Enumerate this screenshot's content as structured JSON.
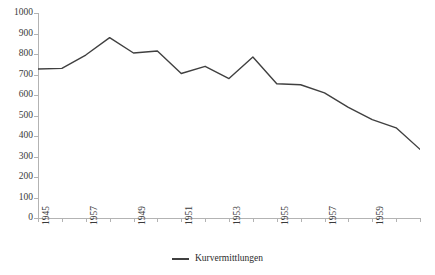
{
  "chart_data": {
    "type": "line",
    "title": "",
    "xlabel": "",
    "ylabel": "",
    "ylim": [
      0,
      1000
    ],
    "ytick_step": 100,
    "yticks": [
      0,
      100,
      200,
      300,
      400,
      500,
      600,
      700,
      800,
      900,
      1000
    ],
    "grid": false,
    "legend_position": "bottom-center",
    "line_color": "#404040",
    "axis_color": "#b3b3b3",
    "text_color": "#3a3a3a",
    "x_tick_labels": [
      "1945",
      "1957",
      "1949",
      "1951",
      "1953",
      "1955",
      "1957",
      "1959"
    ],
    "x_label_step": 2,
    "x": [
      1945,
      1946,
      1947,
      1948,
      1949,
      1950,
      1951,
      1952,
      1953,
      1954,
      1955,
      1956,
      1957,
      1958,
      1959,
      1960,
      1961
    ],
    "series": [
      {
        "name": "Kurvermittlungen",
        "values": [
          727,
          730,
          795,
          880,
          805,
          815,
          705,
          740,
          680,
          785,
          655,
          650,
          610,
          540,
          480,
          440,
          335
        ]
      }
    ]
  },
  "legend": {
    "entries": [
      {
        "label": "Kurvermittlungen",
        "color": "#404040",
        "marker": "line-swatch"
      }
    ]
  },
  "axes": {
    "y": {
      "labels": [
        "1000",
        "900",
        "800",
        "700",
        "600",
        "500",
        "400",
        "300",
        "200",
        "100",
        "0"
      ]
    },
    "x": {
      "labels": [
        "1945",
        "1957",
        "1949",
        "1951",
        "1953",
        "1955",
        "1957",
        "1959"
      ]
    }
  }
}
